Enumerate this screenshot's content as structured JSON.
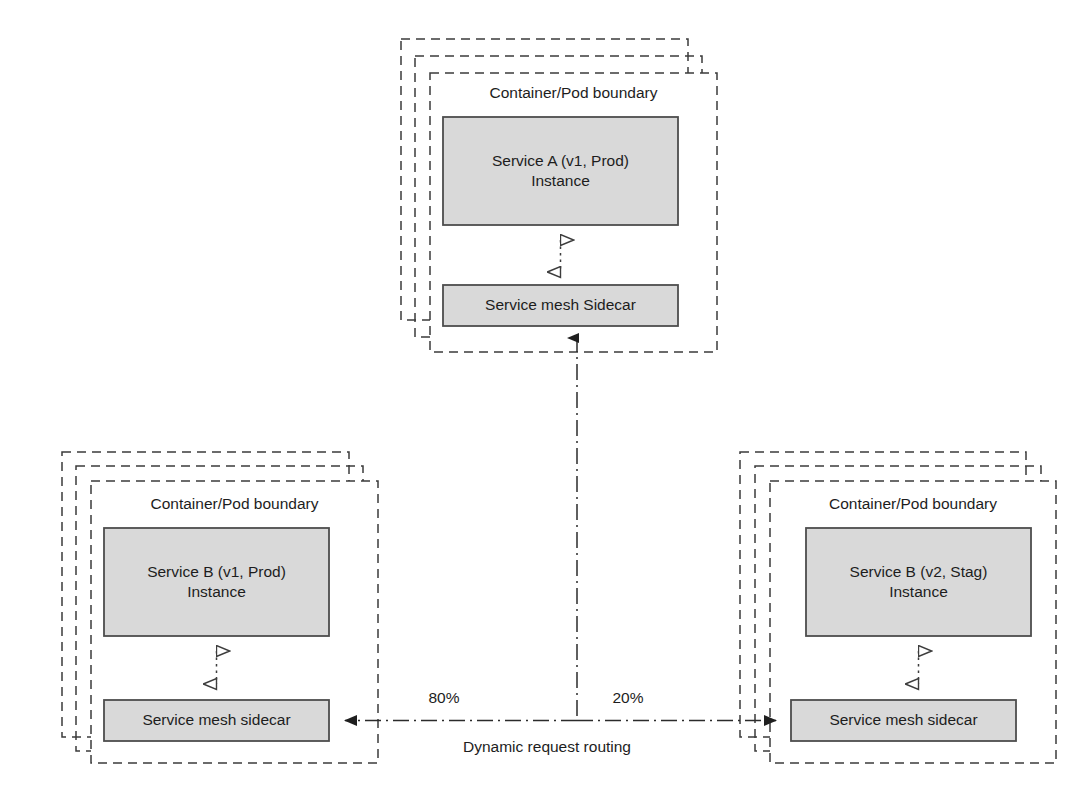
{
  "diagram": {
    "colors": {
      "box_fill": "#d9d9d9",
      "box_stroke": "#4d4d4d",
      "dashed_stroke": "#3b3b3b",
      "line": "#2b2b2b",
      "text": "#1d1d1d",
      "background": "#ffffff"
    }
  },
  "clusters": {
    "top": {
      "pod_label": "Container/Pod boundary",
      "service_label": "Service A (v1, Prod)\nInstance",
      "sidecar_label": "Service mesh Sidecar"
    },
    "bottom_left": {
      "pod_label": "Container/Pod boundary",
      "service_label": "Service B (v1, Prod)\nInstance",
      "sidecar_label": "Service mesh sidecar"
    },
    "bottom_right": {
      "pod_label": "Container/Pod boundary",
      "service_label": "Service B (v2, Stag)\nInstance",
      "sidecar_label": "Service mesh sidecar"
    }
  },
  "routing": {
    "left_share": "80%",
    "right_share": "20%",
    "caption": "Dynamic request routing"
  },
  "icons": {
    "hollow_arrow_up": "hollow-triangle-up-icon",
    "hollow_arrow_down": "hollow-triangle-down-icon",
    "solid_arrow_up": "solid-arrow-up-icon",
    "solid_arrow_left": "solid-arrow-left-icon",
    "solid_arrow_right": "solid-arrow-right-icon"
  }
}
